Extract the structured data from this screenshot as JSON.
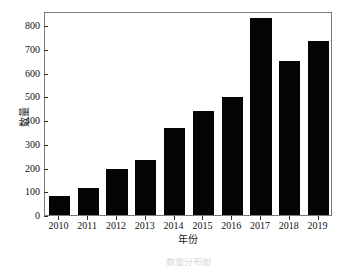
{
  "chart_data": {
    "type": "bar",
    "title": "",
    "xlabel": "年份",
    "ylabel": "数量",
    "categories": [
      "2010",
      "2011",
      "2012",
      "2013",
      "2014",
      "2015",
      "2016",
      "2017",
      "2018",
      "2019"
    ],
    "values": [
      80,
      112,
      196,
      232,
      366,
      440,
      498,
      830,
      650,
      735
    ],
    "ylim": [
      0,
      860
    ],
    "yticks": [
      0,
      100,
      200,
      300,
      400,
      500,
      600,
      700,
      800
    ],
    "ytick_labels": [
      "0",
      "100",
      "200",
      "300",
      "400",
      "500",
      "600",
      "700",
      "800"
    ],
    "grid": false,
    "legend": false,
    "bar_color": "#050505",
    "frame_color": "#7a7a7a",
    "axis_text_color": "#111111"
  },
  "caption": {
    "text": "数量分布图"
  }
}
